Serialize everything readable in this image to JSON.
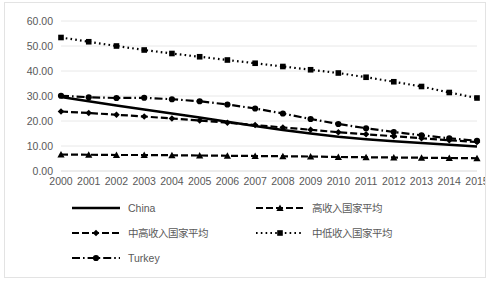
{
  "chart_data": {
    "type": "line",
    "title": "",
    "xlabel": "",
    "ylabel": "",
    "grid": true,
    "legend_position": "bottom",
    "xlim": [
      2000,
      2015
    ],
    "ylim": [
      0,
      60
    ],
    "ytick_step": 10,
    "categories": [
      "2000",
      "2001",
      "2002",
      "2003",
      "2004",
      "2005",
      "2006",
      "2007",
      "2008",
      "2009",
      "2010",
      "2011",
      "2012",
      "2013",
      "2014",
      "2015"
    ],
    "ytick_labels": [
      "0.00",
      "10.00",
      "20.00",
      "30.00",
      "40.00",
      "50.00",
      "60.00"
    ],
    "series": [
      {
        "name": "China",
        "style": "solid",
        "marker": "none",
        "values": [
          29.6,
          27.9,
          26.2,
          24.6,
          23.0,
          21.4,
          19.7,
          18.0,
          16.4,
          15.0,
          13.7,
          12.7,
          11.9,
          11.2,
          10.5,
          9.8
        ]
      },
      {
        "name": "高收入国家平均",
        "style": "dash-marker",
        "marker": "triangle",
        "values": [
          6.6,
          6.5,
          6.4,
          6.4,
          6.3,
          6.2,
          6.1,
          6.0,
          5.9,
          5.8,
          5.6,
          5.5,
          5.4,
          5.3,
          5.2,
          5.1
        ]
      },
      {
        "name": "中高收入国家平均",
        "style": "dash-marker",
        "marker": "diamond",
        "values": [
          23.8,
          23.2,
          22.5,
          21.8,
          21.0,
          20.2,
          19.3,
          18.4,
          17.4,
          16.5,
          15.5,
          14.7,
          13.9,
          13.1,
          12.3,
          11.6
        ]
      },
      {
        "name": "中低收入国家平均",
        "style": "dotted-marker",
        "marker": "square",
        "values": [
          53.4,
          51.7,
          50.0,
          48.4,
          47.0,
          45.7,
          44.4,
          43.1,
          41.8,
          40.5,
          39.2,
          37.5,
          35.7,
          33.8,
          31.4,
          29.2
        ]
      },
      {
        "name": "Turkey",
        "style": "dash-dot-marker",
        "marker": "circle",
        "values": [
          30.1,
          29.5,
          29.2,
          29.3,
          28.7,
          27.9,
          26.6,
          25.0,
          23.0,
          20.8,
          18.8,
          17.1,
          15.6,
          14.3,
          13.1,
          12.1
        ]
      }
    ]
  },
  "legend": {
    "rows": [
      [
        {
          "label": "China",
          "series": 0
        },
        {
          "label": "高收入国家平均",
          "series": 1
        }
      ],
      [
        {
          "label": "中高收入国家平均",
          "series": 2
        },
        {
          "label": "中低收入国家平均",
          "series": 3
        }
      ],
      [
        {
          "label": "Turkey",
          "series": 4
        }
      ]
    ]
  },
  "colors": {
    "series": "#000000",
    "grid": "#e8e8e8",
    "tick_text": "#595959",
    "frame": "#e3e3e3",
    "background": "#ffffff"
  }
}
